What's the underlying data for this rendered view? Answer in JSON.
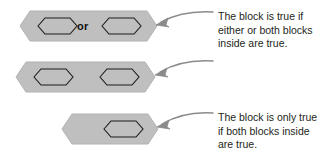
{
  "diagram": {
    "background_color": "#ffffff",
    "block_fill_color": "#bfbfbf",
    "block_outline_color": "#9a9a9a",
    "inner_slot_fill_color": "#bfbfbf",
    "inner_slot_outline_color": "#1a1a1a",
    "label_color": "#111111",
    "caption_color": "#231f20",
    "arrow_color": "#8b8b8b"
  },
  "rows": [
    {
      "id": "or",
      "operator_label": "or",
      "slots": [
        "empty-boolean-slot",
        "empty-boolean-slot"
      ],
      "slot_count": 2,
      "caption": "The block is true if\neither or both blocks\ninside are true.",
      "arrow": "curved-arrow-pointing-left"
    },
    {
      "id": "and",
      "operator_label": "and",
      "slots": [
        "empty-boolean-slot",
        "empty-boolean-slot"
      ],
      "slot_count": 2,
      "caption": "The block is only true\nif both blocks inside\nare true.",
      "arrow": "curved-arrow-pointing-left"
    },
    {
      "id": "not",
      "operator_label": "not",
      "slots": [
        "empty-boolean-slot"
      ],
      "slot_count": 1,
      "caption": "The block is only\ntrue if the block\ninside is false.",
      "arrow": "curved-arrow-pointing-left"
    }
  ]
}
